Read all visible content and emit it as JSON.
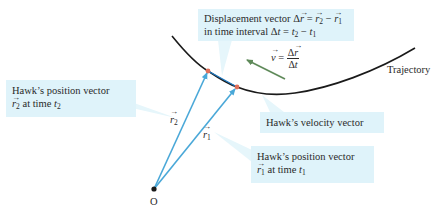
{
  "colors": {
    "callout_bg": "#dff3fa",
    "callout_wedge": "#e6f6fb",
    "position_vector": "#4aa8d8",
    "trajectory": "#1a1a1a",
    "velocity_arrow": "#5f8a5a",
    "point_marker": "#e0705a",
    "origin": "#1a1a1a"
  },
  "origin": {
    "label": "O"
  },
  "trajectory": {
    "label": "Trajectory"
  },
  "vectors": {
    "r2": {
      "symbol": "r",
      "subscript": "2"
    },
    "r1": {
      "symbol": "r",
      "subscript": "1"
    },
    "velocity": {
      "lhs": "v",
      "num": "Δr",
      "den": "Δt"
    }
  },
  "callouts": {
    "displacement": {
      "line1_prefix": "Displacement vector ",
      "line1_delta": "Δ",
      "line1_r": "r",
      "line1_eq": " = ",
      "line1_r2": "r",
      "line1_r2_sub": "2",
      "line1_minus": " − ",
      "line1_r1": "r",
      "line1_r1_sub": "1",
      "line2_prefix": "in time interval ",
      "line2_delta": "Δ",
      "line2_t": "t",
      "line2_eq": " = ",
      "line2_t2": "t",
      "line2_t2_sub": "2",
      "line2_minus": " − ",
      "line2_t1": "t",
      "line2_t1_sub": "1"
    },
    "position_r2": {
      "line1": "Hawk’s position vector",
      "vec": "r",
      "vec_sub": "2",
      "at_time": " at time ",
      "t": "t",
      "t_sub": "2"
    },
    "velocity": {
      "line1": "Hawk’s velocity vector"
    },
    "position_r1": {
      "line1": "Hawk’s position vector",
      "vec": "r",
      "vec_sub": "1",
      "at_time": " at time ",
      "t": "t",
      "t_sub": "1"
    }
  }
}
